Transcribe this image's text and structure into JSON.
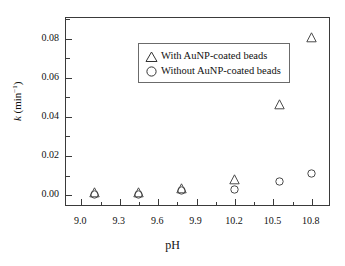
{
  "chart_data": {
    "type": "scatter",
    "title": "",
    "xlabel": "pH",
    "ylabel": "k (min⁻¹)",
    "xlim": [
      8.88,
      10.95
    ],
    "ylim": [
      -0.006,
      0.0905
    ],
    "grid": false,
    "legend_position": "upper-left",
    "xticks": [
      "9.0",
      "9.3",
      "9.6",
      "9.9",
      "10.2",
      "10.5",
      "10.8"
    ],
    "xtick_values": [
      9.0,
      9.3,
      9.6,
      9.9,
      10.2,
      10.5,
      10.8
    ],
    "yticks": [
      "0.00",
      "0.02",
      "0.04",
      "0.06",
      "0.08"
    ],
    "ytick_values": [
      0.0,
      0.02,
      0.04,
      0.06,
      0.08
    ],
    "x": [
      9.1,
      9.45,
      9.78,
      10.2,
      10.55,
      10.8
    ],
    "series": [
      {
        "name": "With AuNP-coated beads",
        "marker": "open-triangle",
        "values": [
          0.0013,
          0.0012,
          0.0032,
          0.008,
          0.0463,
          0.0803
        ]
      },
      {
        "name": "Without AuNP-coated beads",
        "marker": "open-circle",
        "values": [
          0.0006,
          0.0005,
          0.0022,
          0.003,
          0.0069,
          0.0109
        ]
      }
    ]
  },
  "legend": {
    "entries": [
      {
        "label": "With AuNP-coated beads",
        "glyph": "triangle-marker"
      },
      {
        "label": "Without AuNP-coated beads",
        "glyph": "circle-marker"
      }
    ]
  },
  "axes": {
    "x_title": "pH",
    "y_title_prefix": "k",
    "y_title_suffix": " (min",
    "y_title_exponent": "−1",
    "y_title_close": ")"
  }
}
